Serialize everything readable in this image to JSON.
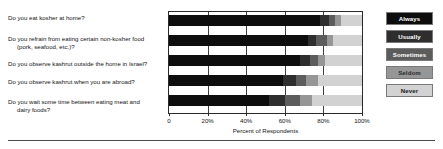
{
  "chart_data": {
    "type": "bar",
    "subtype": "horizontal-stacked-bar",
    "title": "",
    "xlabel": "Percent of Respondents",
    "ylabel": "",
    "xlim": [
      0,
      100
    ],
    "xticks": [
      0,
      20,
      40,
      60,
      80,
      100
    ],
    "xtick_labels": [
      "0",
      "20%",
      "40%",
      "60%",
      "80%",
      "100%"
    ],
    "grid": true,
    "legend_position": "right",
    "stacked_to_100": true,
    "categories": [
      "Do you eat kosher at home?",
      "Do you refrain from eating certain non-kosher food (pork, seafood, etc.)?",
      "Do you observe kashrut outside the home  in Israel?",
      "Do you observe kashrut when you are abroad?",
      "Do you wait some time between eating meat and dairy foods?"
    ],
    "series": [
      {
        "name": "Always",
        "color": "#0d0d0d",
        "values": [
          78,
          72,
          68,
          59,
          52
        ]
      },
      {
        "name": "Usually",
        "color": "#2e2e2e",
        "values": [
          5,
          4,
          5,
          7,
          8
        ]
      },
      {
        "name": "Sometimes",
        "color": "#5c5c5c",
        "values": [
          3,
          6,
          4,
          5,
          8
        ]
      },
      {
        "name": "Seldom",
        "color": "#969696",
        "values": [
          3,
          3,
          4,
          6,
          6
        ]
      },
      {
        "name": "Never",
        "color": "#d2d2d2",
        "values": [
          11,
          15,
          19,
          23,
          26
        ]
      }
    ]
  },
  "questions": [
    {
      "line1": "Do you eat kosher at home?",
      "line2": ""
    },
    {
      "line1": "Do you refrain from eating certain non-kosher food",
      "line2": "(pork, seafood, etc.)?"
    },
    {
      "line1": "Do you observe kashrut outside the home  in Israel?",
      "line2": ""
    },
    {
      "line1": "Do you observe kashrut when you are abroad?",
      "line2": ""
    },
    {
      "line1": "Do you wait some time between eating meat and",
      "line2": "dairy foods?"
    }
  ],
  "axis": {
    "title": "Percent of Respondents",
    "ticks": [
      "0",
      "20%",
      "40%",
      "60%",
      "80%",
      "100%"
    ]
  },
  "legend": {
    "items": [
      {
        "label": "Always",
        "color": "#0d0d0d",
        "text_color": "#ffffff"
      },
      {
        "label": "Usually",
        "color": "#2e2e2e",
        "text_color": "#ffffff"
      },
      {
        "label": "Sometimes",
        "color": "#5c5c5c",
        "text_color": "#ffffff"
      },
      {
        "label": "Seldom",
        "color": "#969696",
        "text_color": "#2a2a2a"
      },
      {
        "label": "Never",
        "color": "#d2d2d2",
        "text_color": "#1a1a1a"
      }
    ]
  }
}
